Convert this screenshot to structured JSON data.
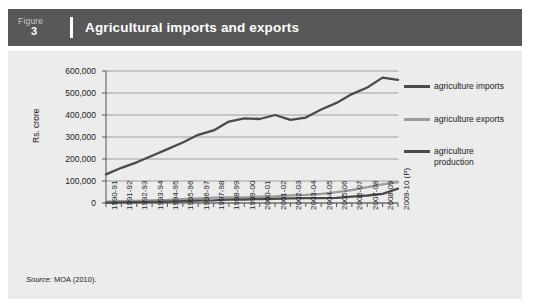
{
  "header": {
    "figure_word": "Figure",
    "figure_number": "3",
    "title": "Agricultural imports and exports"
  },
  "source": {
    "label": "Source:",
    "text": "MOA (2010)."
  },
  "legend": [
    {
      "name": "agriculture imports",
      "color": "#4a4a4a"
    },
    {
      "name": "agriculture exports",
      "color": "#9b9b9b"
    },
    {
      "name": "agriculture production",
      "color": "#4a4a4a"
    }
  ],
  "chart_data": {
    "type": "line",
    "title": "Agricultural imports and exports",
    "xlabel": "",
    "ylabel": "Rs. crore",
    "ylim": [
      0,
      600000
    ],
    "ytick_values": [
      0,
      100000,
      200000,
      300000,
      400000,
      500000,
      600000
    ],
    "ytick_labels": [
      "0",
      "100,000",
      "200,000",
      "300,000",
      "400,000",
      "500,000",
      "600,000"
    ],
    "grid": true,
    "legend_position": "right",
    "categories": [
      "1990-91",
      "1991-92",
      "1992-93",
      "1993-94",
      "1994-95",
      "1995-96",
      "1996-97",
      "1997-98",
      "1998-99",
      "1999-00",
      "2000-01",
      "2001-02",
      "2002-03",
      "2003-04",
      "2004-05",
      "2005-06",
      "2006-07",
      "2007-08",
      "2008-09",
      "2009-10 (P)"
    ],
    "series": [
      {
        "name": "agriculture production",
        "color": "#4a4a4a",
        "values": [
          130000,
          160000,
          185000,
          215000,
          245000,
          275000,
          310000,
          330000,
          370000,
          385000,
          382000,
          400000,
          378000,
          388000,
          425000,
          455000,
          495000,
          525000,
          570000,
          560000
        ]
      },
      {
        "name": "agriculture exports",
        "color": "#9b9b9b",
        "values": [
          6000,
          8000,
          9500,
          12500,
          13500,
          17500,
          20500,
          24500,
          25500,
          25500,
          28500,
          29500,
          34500,
          37000,
          41500,
          49000,
          59000,
          72000,
          85000,
          95000
        ]
      },
      {
        "name": "agriculture imports",
        "color": "#4a4a4a",
        "values": [
          1200,
          2500,
          4000,
          5500,
          6500,
          8000,
          10500,
          12000,
          15000,
          16000,
          18000,
          19000,
          21000,
          22000,
          22500,
          23000,
          29000,
          34000,
          42000,
          65000
        ]
      }
    ]
  }
}
